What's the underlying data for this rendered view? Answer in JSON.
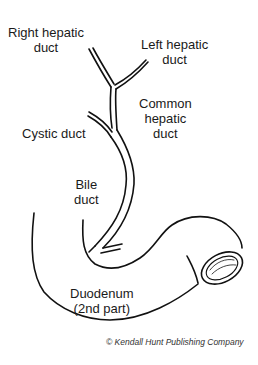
{
  "diagram": {
    "type": "anatomical line drawing",
    "labels": {
      "right_hepatic_duct": [
        "Right hepatic",
        "duct"
      ],
      "left_hepatic_duct": [
        "Left hepatic",
        "duct"
      ],
      "common_hepatic_duct": [
        "Common",
        "hepatic",
        "duct"
      ],
      "cystic_duct": [
        "Cystic duct"
      ],
      "bile_duct": [
        "Bile",
        "duct"
      ],
      "duodenum": [
        "Duodenum",
        "(2nd part)"
      ]
    },
    "credit": "© Kendall Hunt Publishing Company",
    "colors": {
      "stroke": "#111111",
      "text": "#1a1a1a",
      "background": "#ffffff"
    }
  }
}
